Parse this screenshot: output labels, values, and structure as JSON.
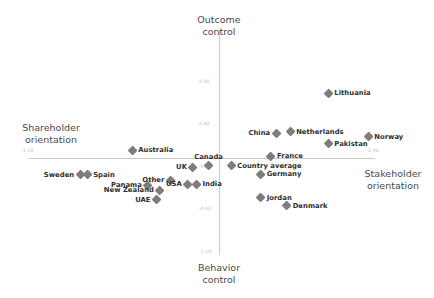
{
  "chart_data": {
    "type": "scatter",
    "title": "",
    "xlabel": "Shareholder orientation — Stakeholder orientation",
    "ylabel": "Behavior control — Outcome control",
    "xlim": [
      -1.1,
      0.9
    ],
    "ylim": [
      -1.1,
      0.9
    ],
    "grid": false,
    "legend": null,
    "axis_titles": {
      "top": "Outcome\ncontrol",
      "bottom": "Behavior\ncontrol",
      "left": "Shareholder\norientation",
      "right": "Stakeholder\norientation"
    },
    "x_ticks": [
      {
        "label": "-1.10",
        "value": -1.1
      },
      {
        "label": "0.90",
        "value": 0.9
      }
    ],
    "y_ticks": [
      {
        "label": "0.90",
        "value": 0.9
      },
      {
        "label": "0.40",
        "value": 0.4
      },
      {
        "label": "-0.10",
        "value": -0.1
      },
      {
        "label": "-0.60",
        "value": -0.6
      },
      {
        "label": "-1.10",
        "value": -1.1
      }
    ],
    "points": [
      {
        "label": "Lithuania",
        "x": 0.63,
        "y": 0.76,
        "pos": "right"
      },
      {
        "label": "China",
        "x": 0.33,
        "y": 0.29,
        "pos": "left"
      },
      {
        "label": "Netherlands",
        "x": 0.41,
        "y": 0.31,
        "pos": "right"
      },
      {
        "label": "Norway",
        "x": 0.86,
        "y": 0.25,
        "pos": "right"
      },
      {
        "label": "Pakistan",
        "x": 0.63,
        "y": 0.17,
        "pos": "right"
      },
      {
        "label": "France",
        "x": 0.3,
        "y": 0.02,
        "pos": "right"
      },
      {
        "label": "Country average",
        "x": 0.07,
        "y": -0.09,
        "pos": "right"
      },
      {
        "label": "Germany",
        "x": 0.24,
        "y": -0.19,
        "pos": "right"
      },
      {
        "label": "Jordan",
        "x": 0.24,
        "y": -0.47,
        "pos": "right"
      },
      {
        "label": "Denmark",
        "x": 0.39,
        "y": -0.56,
        "pos": "right"
      },
      {
        "label": "Australia",
        "x": -0.5,
        "y": 0.09,
        "pos": "right"
      },
      {
        "label": "Canada",
        "x": -0.06,
        "y": -0.09,
        "pos": "above"
      },
      {
        "label": "UK",
        "x": -0.15,
        "y": -0.11,
        "pos": "left"
      },
      {
        "label": "Sweden",
        "x": -0.8,
        "y": -0.2,
        "pos": "left"
      },
      {
        "label": "Spain",
        "x": -0.76,
        "y": -0.2,
        "pos": "right"
      },
      {
        "label": "Other",
        "x": -0.28,
        "y": -0.26,
        "pos": "left"
      },
      {
        "label": "USA",
        "x": -0.18,
        "y": -0.31,
        "pos": "left"
      },
      {
        "label": "India",
        "x": -0.13,
        "y": -0.31,
        "pos": "right"
      },
      {
        "label": "Panama",
        "x": -0.41,
        "y": -0.32,
        "pos": "left"
      },
      {
        "label": "New Zealand",
        "x": -0.34,
        "y": -0.38,
        "pos": "left"
      },
      {
        "label": "UAE",
        "x": -0.36,
        "y": -0.49,
        "pos": "left"
      }
    ],
    "marker_color": "#7d7d7d",
    "axis_color": "#c9c9c9",
    "text_color": "#2e2e2e"
  }
}
